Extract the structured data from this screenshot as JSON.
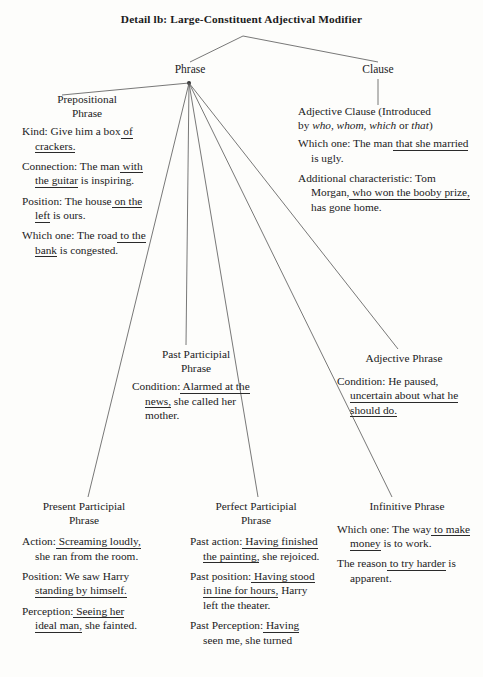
{
  "title": "Detail lb: Large-Constituent Adjectival Modifier",
  "nodes": {
    "phrase": "Phrase",
    "clause": "Clause"
  },
  "groups": {
    "prepositional": {
      "head_line1": "Prepositional",
      "head_line2": "Phrase",
      "entries": [
        {
          "label": "Kind:",
          "parts": [
            {
              "t": " Give him a",
              "u": false
            },
            {
              "t": " box",
              "u": false
            },
            {
              "t": " of crackers.",
              "u": true
            }
          ],
          "text": "Kind: Give him a box of crackers."
        },
        {
          "label": "Connection:",
          "parts": [
            {
              "t": " The man",
              "u": false
            },
            {
              "t": " with the guitar",
              "u": true
            },
            {
              "t": " is inspiring.",
              "u": false
            }
          ],
          "text": "Connection: The man with the guitar is inspiring."
        },
        {
          "label": "Position:",
          "parts": [
            {
              "t": " The house",
              "u": false
            },
            {
              "t": " on the left",
              "u": true
            },
            {
              "t": " is ours.",
              "u": false
            }
          ],
          "text": "Position: The house on the left is ours."
        },
        {
          "label": "Which one:",
          "parts": [
            {
              "t": " The road",
              "u": false
            },
            {
              "t": " to the bank",
              "u": true
            },
            {
              "t": " is congested.",
              "u": false
            }
          ],
          "text": "Which one: The road to the bank is congested."
        }
      ]
    },
    "adjective_clause": {
      "head_line1": "Adjective Clause (Introduced",
      "head_line2": "by who, whom, which or that)",
      "head_italic_words": [
        "who,",
        "whom,",
        "which",
        "that"
      ],
      "entries": [
        {
          "label": "Which one:",
          "parts": [
            {
              "t": " The man",
              "u": false
            },
            {
              "t": " that she married",
              "u": true
            },
            {
              "t": " is ugly.",
              "u": false
            }
          ],
          "text": "Which one: The man that she married is ugly."
        },
        {
          "label": "Additional characteristic:",
          "parts": [
            {
              "t": " Tom Morgan,",
              "u": false
            },
            {
              "t": " who won the booby prize,",
              "u": true
            },
            {
              "t": " has gone home.",
              "u": false
            }
          ],
          "text": "Additional characteristic: Tom Morgan, who won the booby prize, has gone home."
        }
      ]
    },
    "past_participial": {
      "head_line1": "Past Participial",
      "head_line2": "Phrase",
      "entries": [
        {
          "label": "Condition:",
          "parts": [
            {
              "t": " Alarmed at the news,",
              "u": true
            },
            {
              "t": " she called her mother.",
              "u": false
            }
          ],
          "text": "Condition: Alarmed at the news, she called her mother."
        }
      ]
    },
    "adjective_phrase": {
      "head_line1": "Adjective Phrase",
      "head_line2": "",
      "entries": [
        {
          "label": "Condition:",
          "parts": [
            {
              "t": " He paused,",
              "u": false
            },
            {
              "t": " uncertain about what he should do.",
              "u": true
            }
          ],
          "text": "Condition: He paused, uncertain about what he should do."
        }
      ]
    },
    "present_participial": {
      "head_line1": "Present Participial",
      "head_line2": "Phrase",
      "entries": [
        {
          "label": "Action:",
          "parts": [
            {
              "t": " Screaming loudly,",
              "u": true
            },
            {
              "t": " she ran from the room.",
              "u": false
            }
          ],
          "text": "Action: Screaming loudly, she ran from the room."
        },
        {
          "label": "Position:",
          "parts": [
            {
              "t": " We saw Harry",
              "u": false
            },
            {
              "t": " standing by himself.",
              "u": true
            }
          ],
          "text": "Position: We saw Harry standing by himself."
        },
        {
          "label": "Perception:",
          "parts": [
            {
              "t": " Seeing her ideal man,",
              "u": true
            },
            {
              "t": " she fainted.",
              "u": false
            }
          ],
          "text": "Perception: Seeing her ideal man, she fainted."
        }
      ]
    },
    "perfect_participial": {
      "head_line1": "Perfect Participial",
      "head_line2": "Phrase",
      "entries": [
        {
          "label": "Past action:",
          "parts": [
            {
              "t": " Having finished the painting,",
              "u": true
            },
            {
              "t": " she rejoiced.",
              "u": false
            }
          ],
          "text": "Past action: Having finished the painting, she rejoiced."
        },
        {
          "label": "Past position:",
          "parts": [
            {
              "t": " Having stood in line for hours,",
              "u": true
            },
            {
              "t": " Harry left the theater.",
              "u": false
            }
          ],
          "text": "Past position: Having stood in line for hours, Harry left the theater."
        },
        {
          "label": "Past Perception:",
          "parts": [
            {
              "t": " Having",
              "u": true
            },
            {
              "t": " seen me, she turned",
              "u": false
            }
          ],
          "text": "Past Perception: Having seen me, she turned"
        }
      ]
    },
    "infinitive": {
      "head_line1": "Infinitive Phrase",
      "head_line2": "",
      "entries": [
        {
          "label": "Which one:",
          "parts": [
            {
              "t": " The way",
              "u": false
            },
            {
              "t": " to make money",
              "u": true
            },
            {
              "t": " is to work.",
              "u": false
            }
          ],
          "text": "Which one: The way to make money is to work."
        },
        {
          "label": "",
          "parts": [
            {
              "t": "The reason",
              "u": false
            },
            {
              "t": " to try harder",
              "u": true
            },
            {
              "t": " is apparent.",
              "u": false
            }
          ],
          "text": "The reason to try harder is apparent."
        }
      ]
    }
  },
  "colors": {
    "ink": "#1b1b1b",
    "line": "#555555",
    "background": "#fdfdfb"
  }
}
